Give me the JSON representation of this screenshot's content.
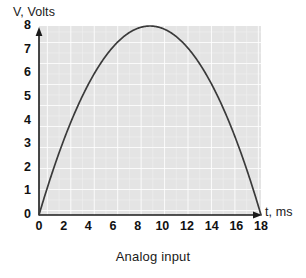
{
  "chart_data": {
    "type": "line",
    "title": "",
    "caption": "Analog input",
    "xlabel": "t, ms",
    "ylabel": "V, Volts",
    "xlim": [
      0,
      18
    ],
    "ylim": [
      0,
      8
    ],
    "xticks": [
      0,
      2,
      4,
      6,
      8,
      10,
      12,
      14,
      16,
      18
    ],
    "yticks": [
      0,
      1,
      2,
      3,
      4,
      5,
      6,
      7,
      8
    ],
    "grid": true,
    "grid_major_step_x": 2,
    "grid_major_step_y": 1,
    "grid_minor_divisions": 2,
    "legend": null,
    "series": [
      {
        "name": "V(t)",
        "description": "Parabolic analog waveform peaking at 8 V at t = 9 ms",
        "x": [
          0,
          0.5,
          1,
          1.5,
          2,
          2.5,
          3,
          3.5,
          4,
          4.5,
          5,
          5.5,
          6,
          6.5,
          7,
          7.5,
          8,
          8.5,
          9,
          9.5,
          10,
          10.5,
          11,
          11.5,
          12,
          12.5,
          13,
          13.5,
          14,
          14.5,
          15,
          15.5,
          16,
          16.5,
          17,
          17.5,
          18
        ],
        "y": [
          0.0,
          0.84,
          1.58,
          2.22,
          2.77,
          3.24,
          3.63,
          3.96,
          4.21,
          4.42,
          4.57,
          4.68,
          4.75,
          4.79,
          4.79,
          4.77,
          4.72,
          4.65,
          8.0,
          7.98,
          7.9,
          7.78,
          7.6,
          7.38,
          7.11,
          6.79,
          6.42,
          6.0,
          5.53,
          5.02,
          4.45,
          3.84,
          3.17,
          2.46,
          1.7,
          0.89,
          0.0
        ]
      }
    ],
    "curve_formula": "V = 8 - (8/81)*(t-9)^2",
    "peak": {
      "t": 9,
      "V": 8
    },
    "zeros": [
      0,
      18
    ],
    "colors": {
      "curve": "#3a3a3a",
      "axis": "#1a1a1a",
      "plot_background": "#e4e4e4",
      "grid_major": "#ffffff",
      "grid_minor": "#f0f0f0",
      "text": "#111111"
    }
  }
}
